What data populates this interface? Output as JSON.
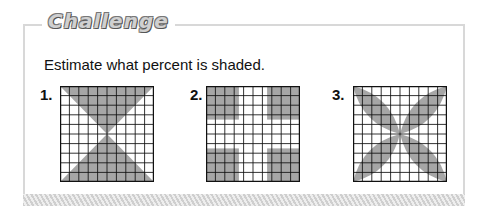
{
  "header": {
    "title": "Challenge"
  },
  "prompt": "Estimate what percent is shaded.",
  "problems": [
    {
      "number": "1.",
      "description": "10x10 grid with two shaded triangles (hourglass) meeting at center"
    },
    {
      "number": "2.",
      "description": "10x10 grid with four shaded 4x4 corner squares"
    },
    {
      "number": "3.",
      "description": "10x10 grid with four shaded leaf shapes along diagonals"
    }
  ],
  "colors": {
    "shade": "#a6a6a6",
    "grid_line": "#111111",
    "frame": "#d8d8d8"
  }
}
